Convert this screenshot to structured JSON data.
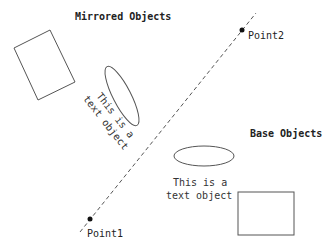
{
  "diagram": {
    "headings": {
      "mirrored": "Mirrored Objects",
      "base": "Base Objects"
    },
    "points": {
      "point1": {
        "label": "Point1",
        "x": 91,
        "y": 218
      },
      "point2": {
        "label": "Point2",
        "x": 242,
        "y": 30
      }
    },
    "mirror_line": {
      "style": "dashed",
      "color": "#555555"
    },
    "base_objects": {
      "text_line1": "This is a",
      "text_line2": "text object",
      "ellipse": {
        "cx": 204,
        "cy": 156,
        "rx": 30,
        "ry": 10
      },
      "rectangle": {
        "x": 238,
        "y": 192,
        "width": 56,
        "height": 43
      }
    },
    "mirrored_objects": {
      "text_line1": "This is a",
      "text_line2": "text object"
    },
    "colors": {
      "stroke": "#555555",
      "text": "#222222",
      "background": "#ffffff"
    }
  }
}
